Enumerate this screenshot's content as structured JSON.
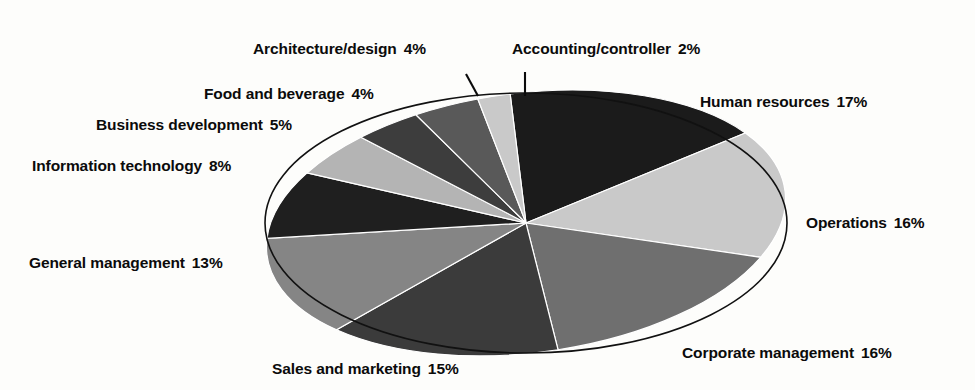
{
  "chart_data": {
    "type": "pie",
    "title": "",
    "subtitle": "",
    "xlabel": "",
    "ylabel": "",
    "legend_position": "none",
    "grid": false,
    "value_unit": "%",
    "total": 100,
    "categories": [
      "Human resources",
      "Operations",
      "Corporate management",
      "Sales and marketing",
      "General management",
      "Information technology",
      "Business development",
      "Food and beverage",
      "Architecture/design",
      "Accounting/controller"
    ],
    "values": [
      17,
      16,
      16,
      15,
      13,
      8,
      5,
      4,
      4,
      2
    ],
    "slices": [
      {
        "label": "Human resources",
        "value": 17,
        "pct_text": "17%",
        "color": "#1b1b1b",
        "leader": false
      },
      {
        "label": "Operations",
        "value": 16,
        "pct_text": "16%",
        "color": "#c9c9c9",
        "leader": false
      },
      {
        "label": "Corporate management",
        "value": 16,
        "pct_text": "16%",
        "color": "#6f6f6f",
        "leader": false
      },
      {
        "label": "Sales and marketing",
        "value": 15,
        "pct_text": "15%",
        "color": "#3b3b3b",
        "leader": false
      },
      {
        "label": "General management",
        "value": 13,
        "pct_text": "13%",
        "color": "#858585",
        "leader": false
      },
      {
        "label": "Information technology",
        "value": 8,
        "pct_text": "8%",
        "color": "#1f1f1f",
        "leader": false
      },
      {
        "label": "Business development",
        "value": 5,
        "pct_text": "5%",
        "color": "#b4b4b4",
        "leader": false
      },
      {
        "label": "Food and beverage",
        "value": 4,
        "pct_text": "4%",
        "color": "#3d3d3d",
        "leader": false
      },
      {
        "label": "Architecture/design",
        "value": 4,
        "pct_text": "4%",
        "color": "#595959",
        "leader": true
      },
      {
        "label": "Accounting/controller",
        "value": 2,
        "pct_text": "2%",
        "color": "#c9c9c9",
        "leader": true
      }
    ],
    "colors": {
      "background": "#fdfdfb",
      "text": "#0b0b0b",
      "outline": "#111111"
    }
  }
}
